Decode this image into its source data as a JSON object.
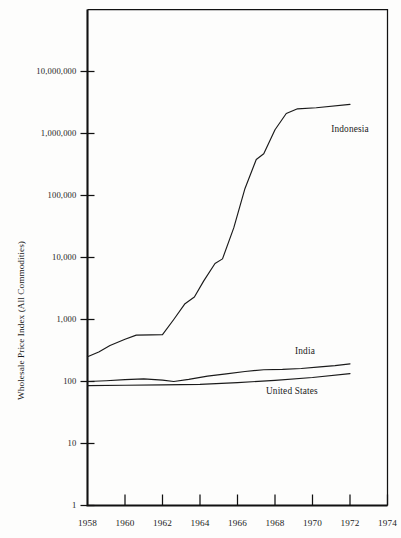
{
  "chart_data": {
    "type": "line",
    "title": "",
    "xlabel": "",
    "ylabel": "Wholesale Price Index (All Commodities)",
    "yscale": "log",
    "ylim": [
      1,
      100000000
    ],
    "xlim": [
      1958,
      1974
    ],
    "grid": false,
    "legend_position": "inline-right-of-series",
    "y_ticks": [
      {
        "value": 1,
        "label": "1"
      },
      {
        "value": 10,
        "label": "10"
      },
      {
        "value": 100,
        "label": "100"
      },
      {
        "value": 1000,
        "label": "1,000"
      },
      {
        "value": 10000,
        "label": "10,000"
      },
      {
        "value": 100000,
        "label": "100,000"
      },
      {
        "value": 1000000,
        "label": "1,000,000"
      },
      {
        "value": 10000000,
        "label": "10,000,000"
      }
    ],
    "x_ticks": [
      {
        "value": 1958,
        "label": "1958"
      },
      {
        "value": 1960,
        "label": "1960"
      },
      {
        "value": 1962,
        "label": "1962"
      },
      {
        "value": 1964,
        "label": "1964"
      },
      {
        "value": 1966,
        "label": "1966"
      },
      {
        "value": 1968,
        "label": "1968"
      },
      {
        "value": 1970,
        "label": "1970"
      },
      {
        "value": 1972,
        "label": "1972"
      },
      {
        "value": 1974,
        "label": "1974"
      }
    ],
    "series": [
      {
        "name": "Indonesia",
        "label": "Indonesia",
        "color": "#1a1a1a",
        "label_x": 1972.0,
        "label_y": 1150000,
        "points": [
          {
            "x": 1958.0,
            "y": 250
          },
          {
            "x": 1958.6,
            "y": 300
          },
          {
            "x": 1959.2,
            "y": 380
          },
          {
            "x": 1960.0,
            "y": 480
          },
          {
            "x": 1960.6,
            "y": 560
          },
          {
            "x": 1961.4,
            "y": 565
          },
          {
            "x": 1962.0,
            "y": 570
          },
          {
            "x": 1962.6,
            "y": 1000
          },
          {
            "x": 1963.2,
            "y": 1800
          },
          {
            "x": 1963.7,
            "y": 2300
          },
          {
            "x": 1964.2,
            "y": 4200
          },
          {
            "x": 1964.8,
            "y": 8000
          },
          {
            "x": 1965.2,
            "y": 9500
          },
          {
            "x": 1965.8,
            "y": 30000
          },
          {
            "x": 1966.4,
            "y": 130000
          },
          {
            "x": 1967.0,
            "y": 380000
          },
          {
            "x": 1967.4,
            "y": 470000
          },
          {
            "x": 1968.0,
            "y": 1150000
          },
          {
            "x": 1968.6,
            "y": 2100000
          },
          {
            "x": 1969.2,
            "y": 2500000
          },
          {
            "x": 1970.2,
            "y": 2600000
          },
          {
            "x": 1972.0,
            "y": 2950000
          }
        ]
      },
      {
        "name": "India",
        "label": "India",
        "color": "#1a1a1a",
        "label_x": 1969.6,
        "label_y": 300,
        "points": [
          {
            "x": 1958.0,
            "y": 100
          },
          {
            "x": 1959.0,
            "y": 103
          },
          {
            "x": 1960.0,
            "y": 107
          },
          {
            "x": 1961.0,
            "y": 110
          },
          {
            "x": 1962.0,
            "y": 105
          },
          {
            "x": 1962.6,
            "y": 100
          },
          {
            "x": 1963.4,
            "y": 108
          },
          {
            "x": 1964.4,
            "y": 122
          },
          {
            "x": 1965.4,
            "y": 133
          },
          {
            "x": 1966.4,
            "y": 145
          },
          {
            "x": 1967.4,
            "y": 155
          },
          {
            "x": 1968.4,
            "y": 157
          },
          {
            "x": 1969.4,
            "y": 162
          },
          {
            "x": 1970.4,
            "y": 172
          },
          {
            "x": 1971.2,
            "y": 180
          },
          {
            "x": 1972.0,
            "y": 192
          }
        ]
      },
      {
        "name": "United States",
        "label": "United States",
        "color": "#1a1a1a",
        "label_x": 1968.9,
        "label_y": 68,
        "points": [
          {
            "x": 1958.0,
            "y": 86
          },
          {
            "x": 1960.0,
            "y": 87
          },
          {
            "x": 1962.0,
            "y": 88
          },
          {
            "x": 1964.0,
            "y": 90
          },
          {
            "x": 1966.0,
            "y": 96
          },
          {
            "x": 1968.0,
            "y": 104
          },
          {
            "x": 1970.0,
            "y": 116
          },
          {
            "x": 1972.0,
            "y": 134
          }
        ]
      }
    ]
  },
  "plot": {
    "frame_color": "#111111",
    "background": "#fdfdfc"
  }
}
